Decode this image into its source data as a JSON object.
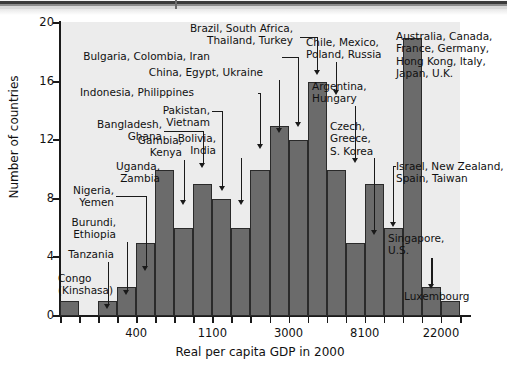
{
  "figure": {
    "background_color": "#ececec",
    "bar_fill_color": "#6b6b6b",
    "bar_edge_color": "#2a2a2a"
  },
  "chart_data": {
    "type": "bar",
    "title": "",
    "subtitle": "",
    "xlabel": "Real per capita GDP in 2000",
    "ylabel": "Number of countries",
    "grid": false,
    "legend": null,
    "ylim": [
      0,
      20
    ],
    "ytick_labels": [
      "0",
      "4",
      "8",
      "12",
      "16",
      "20"
    ],
    "ytick_values": [
      0,
      4,
      8,
      12,
      16,
      20
    ],
    "xtick_labels": [
      "400",
      "1100",
      "3000",
      "8100",
      "22000"
    ],
    "xtick_positions_bin_index": [
      4,
      8,
      12,
      16,
      20
    ],
    "bin_count": 21,
    "categories": [
      "b1",
      "b2",
      "b3",
      "b4",
      "b5",
      "b6",
      "b7",
      "b8",
      "b9",
      "b10",
      "b11",
      "b12",
      "b13",
      "b14",
      "b15",
      "b16",
      "b17",
      "b18",
      "b19",
      "b20",
      "b21"
    ],
    "values": [
      1,
      0,
      1,
      2,
      5,
      10,
      6,
      9,
      8,
      6,
      10,
      13,
      12,
      16,
      10,
      5,
      9,
      6,
      19,
      2,
      1
    ],
    "note": "Histogram of real per capita GDP in 2000 across countries; x axis is on a log scale with labelled ticks 400, 1100, 3000, 8100, 22000."
  },
  "annotations": [
    {
      "id": "congo",
      "text": "Congo\n(Kinshasa)",
      "bar_index": 0
    },
    {
      "id": "tanzania",
      "text": "Tanzania",
      "bar_index": 2
    },
    {
      "id": "burundi",
      "text": "Burundi,\nEthiopia",
      "bar_index": 3
    },
    {
      "id": "nigeria",
      "text": "Nigeria,\nYemen",
      "bar_index": 4
    },
    {
      "id": "uganda",
      "text": "Uganda,\nZambia",
      "bar_index": 5
    },
    {
      "id": "gambia",
      "text": "Gambia,\nKenya",
      "bar_index": 6
    },
    {
      "id": "bangladesh",
      "text": "Bangladesh,\nGhana",
      "bar_index": 7
    },
    {
      "id": "pakistan",
      "text": "Pakistan, Vietnam",
      "bar_index": 8
    },
    {
      "id": "bolivia",
      "text": "Bolivia,\nIndia",
      "bar_index": 9
    },
    {
      "id": "indonesia",
      "text": "Indonesia, Philippines",
      "bar_index": 10
    },
    {
      "id": "china",
      "text": "China, Egypt, Ukraine",
      "bar_index": 11
    },
    {
      "id": "bulgaria",
      "text": "Bulgaria, Colombia, Iran",
      "bar_index": 12
    },
    {
      "id": "brazil",
      "text": "Brazil, South Africa,\nThailand, Turkey",
      "bar_index": 13
    },
    {
      "id": "chile",
      "text": "Chile, Mexico,\nPoland, Russia",
      "bar_index": 14
    },
    {
      "id": "argentina",
      "text": "Argentina,\nHungary",
      "bar_index": 15
    },
    {
      "id": "czech",
      "text": "Czech,\nGreece,\nS. Korea",
      "bar_index": 16
    },
    {
      "id": "israel",
      "text": "Israel, New Zealand,\nSpain, Taiwan",
      "bar_index": 17
    },
    {
      "id": "australia",
      "text": "Australia, Canada,\nFrance, Germany,\nHong Kong, Italy,\nJapan, U.K.",
      "bar_index": 18
    },
    {
      "id": "singapore",
      "text": "Singapore,\nU.S.",
      "bar_index": 19
    },
    {
      "id": "luxembourg",
      "text": "Luxembourg",
      "bar_index": 20
    }
  ]
}
